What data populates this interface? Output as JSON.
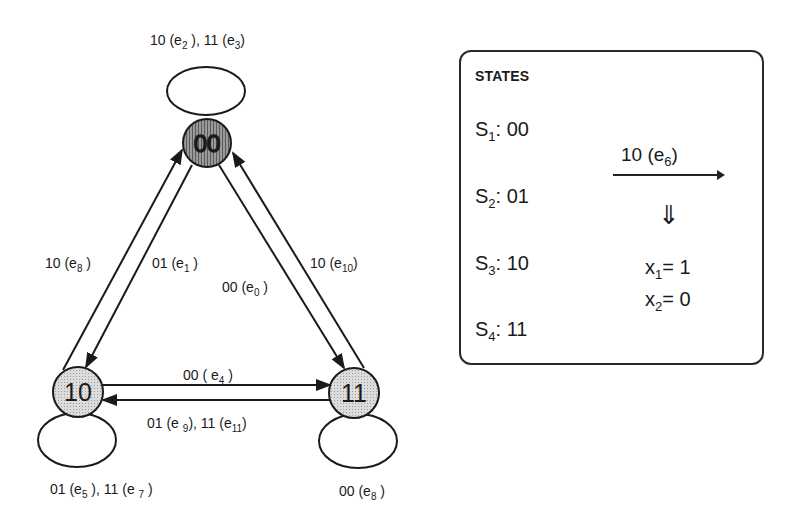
{
  "diagram": {
    "type": "state-transition-graph",
    "nodes": [
      {
        "id": "00",
        "label": "00",
        "shade": "dark"
      },
      {
        "id": "10",
        "label": "10",
        "shade": "light"
      },
      {
        "id": "11",
        "label": "11",
        "shade": "light"
      }
    ],
    "edge_labels": {
      "loop_00": {
        "text": "10 (e",
        "sub1": "2",
        "mid": " ), 11 (e",
        "sub2": "3",
        "end": ")"
      },
      "e8_left": {
        "text": "10 (e",
        "sub": "8",
        "end": " )"
      },
      "e1": {
        "text": "01 (e",
        "sub": "1",
        "end": " )"
      },
      "e0": {
        "text": "00 (e",
        "sub": "0",
        "end": " )"
      },
      "e10": {
        "text": "10 (e",
        "sub": "10",
        "end": ")"
      },
      "e4": {
        "text": "00 ( e",
        "sub": "4",
        "end": " )"
      },
      "e9_e11": {
        "text": "01 (e ",
        "sub1": "9",
        "mid": "), 11 (e",
        "sub2": "11",
        "end": ")"
      },
      "loop_10": {
        "text": "01 (e",
        "sub1": "5",
        "mid": " ), 11 (e ",
        "sub2": "7",
        "end": " )"
      },
      "loop_11": {
        "text": "00 (e",
        "sub": "8",
        "end": "  )"
      }
    }
  },
  "states_panel": {
    "title": "STATES",
    "states": [
      {
        "name": "S",
        "sub": "1",
        "value": ": 00"
      },
      {
        "name": "S",
        "sub": "2",
        "value": ": 01"
      },
      {
        "name": "S",
        "sub": "3",
        "value": ": 10"
      },
      {
        "name": "S",
        "sub": "4",
        "value": ": 11"
      }
    ],
    "transition": {
      "label": "10 (e",
      "sub": "6",
      "end": ")"
    },
    "implies_symbol": "⇓",
    "outputs": [
      {
        "var": "x",
        "sub": "1",
        "value": "= 1"
      },
      {
        "var": "x",
        "sub": "2",
        "value": "= 0"
      }
    ]
  },
  "colors": {
    "stroke": "#1a1a1a",
    "node_dark": "#8a8a8a",
    "node_light": "#d0d0d0",
    "background": "#ffffff"
  }
}
